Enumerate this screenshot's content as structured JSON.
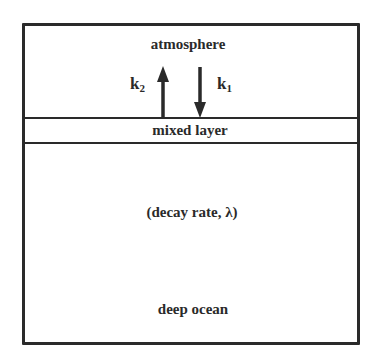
{
  "diagram": {
    "type": "box-model",
    "compartments": [
      {
        "id": "atmosphere",
        "label": "atmosphere"
      },
      {
        "id": "mixed_layer",
        "label": "mixed layer"
      },
      {
        "id": "deep_ocean",
        "label": "deep ocean",
        "annotation": "(decay rate, λ)"
      }
    ],
    "fluxes": [
      {
        "id": "k1",
        "symbol": "k",
        "subscript": "1",
        "direction": "down",
        "from": "atmosphere",
        "to": "mixed_layer"
      },
      {
        "id": "k2",
        "symbol": "k",
        "subscript": "2",
        "direction": "up",
        "from": "mixed_layer",
        "to": "atmosphere"
      }
    ],
    "colors": {
      "line": "#2a2a2a",
      "background": "#ffffff"
    }
  }
}
